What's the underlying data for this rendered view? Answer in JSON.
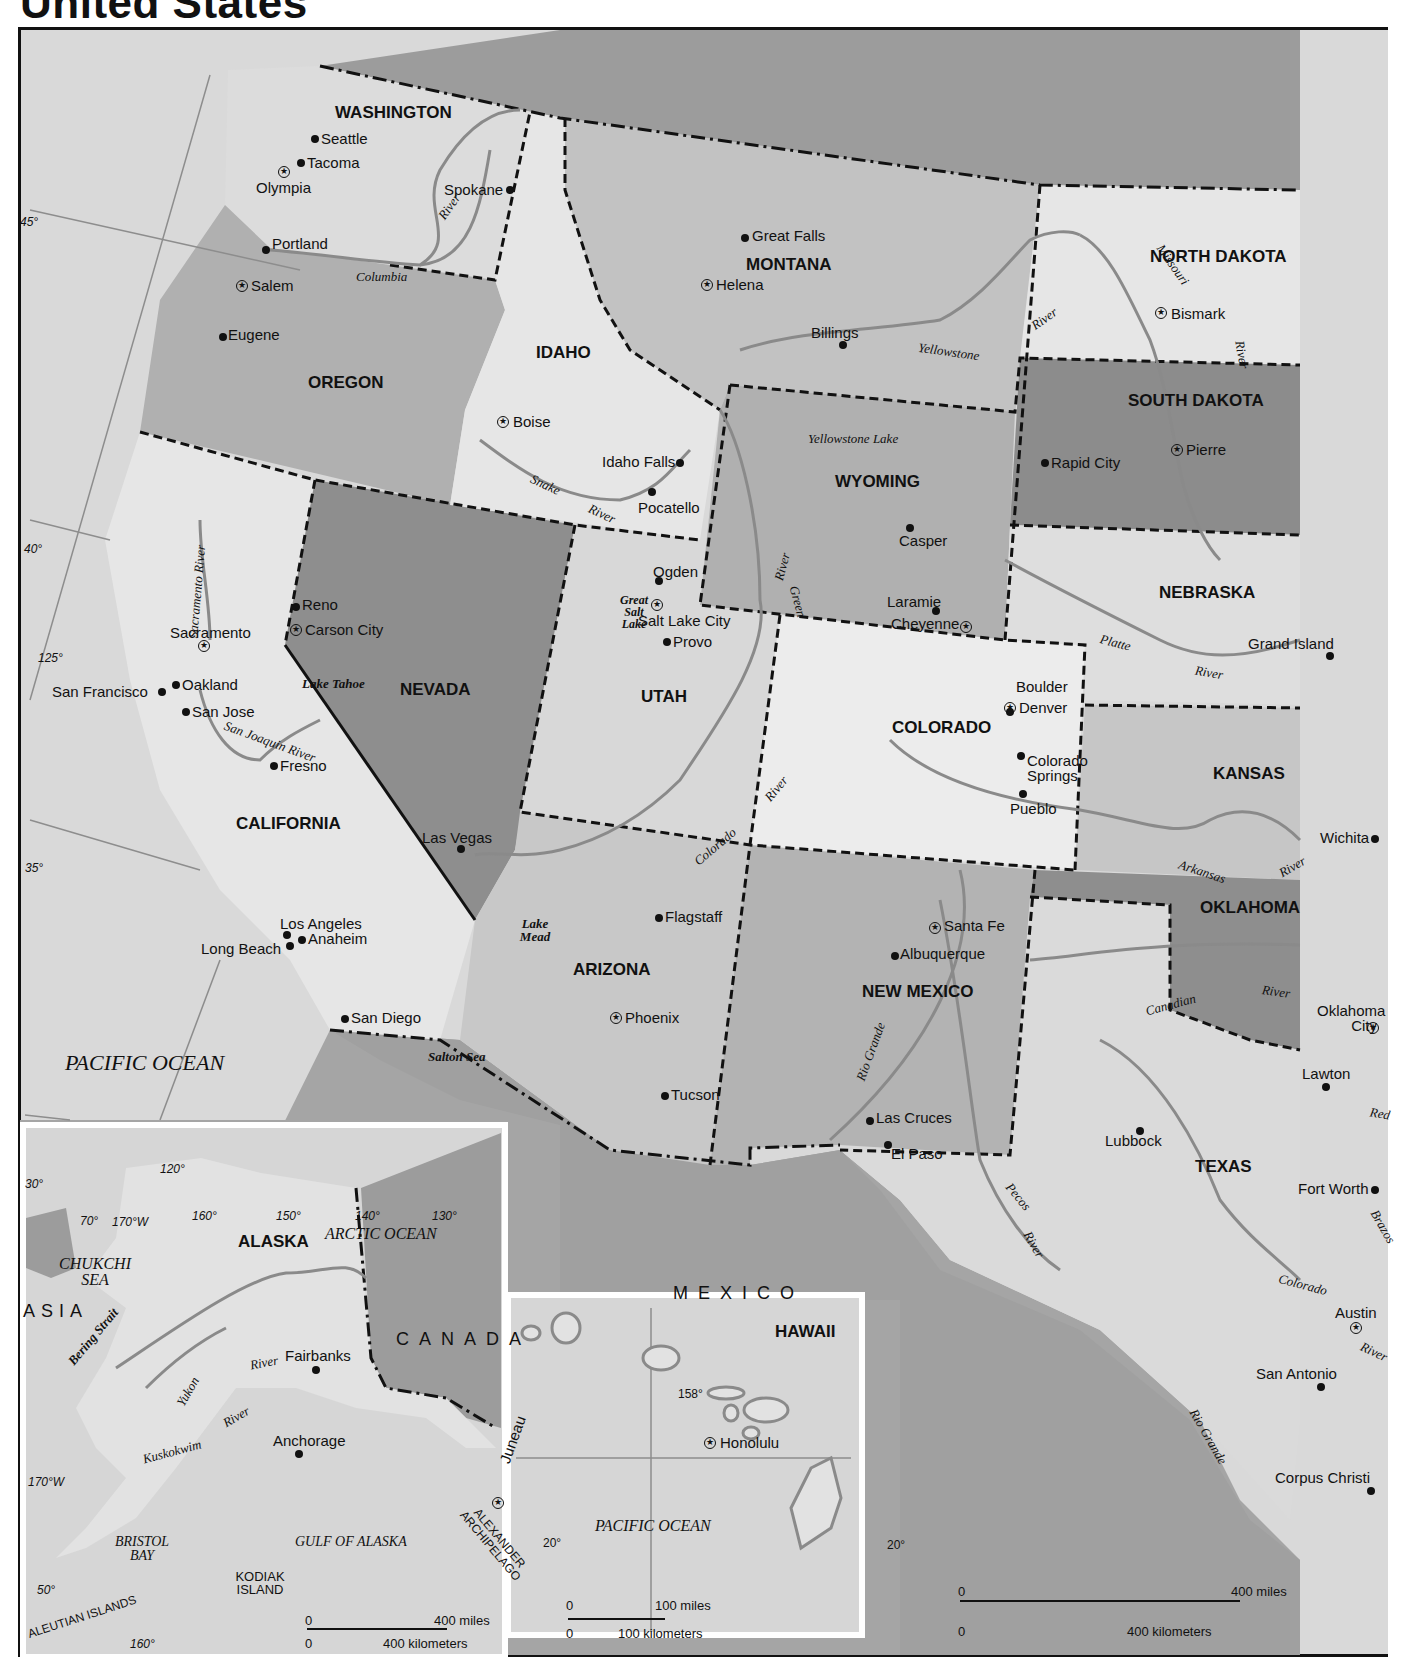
{
  "title": "United States",
  "colors": {
    "ocean": "#d9d9d9",
    "light_state": "#e8e8e8",
    "mid_state": "#b5b5b5",
    "dark_state": "#8e8e8e",
    "foreign": "#9c9c9c",
    "river": "#8a8a8a",
    "border": "#111111"
  },
  "states": [
    {
      "name": "WASHINGTON"
    },
    {
      "name": "OREGON"
    },
    {
      "name": "CALIFORNIA"
    },
    {
      "name": "IDAHO"
    },
    {
      "name": "NEVADA"
    },
    {
      "name": "MONTANA"
    },
    {
      "name": "WYOMING"
    },
    {
      "name": "UTAH"
    },
    {
      "name": "ARIZONA"
    },
    {
      "name": "COLORADO"
    },
    {
      "name": "NEW MEXICO"
    },
    {
      "name": "NORTH DAKOTA"
    },
    {
      "name": "SOUTH DAKOTA"
    },
    {
      "name": "NEBRASKA"
    },
    {
      "name": "KANSAS"
    },
    {
      "name": "OKLAHOMA"
    },
    {
      "name": "TEXAS"
    },
    {
      "name": "ALASKA"
    },
    {
      "name": "HAWAII"
    }
  ],
  "cities": [
    {
      "name": "Seattle"
    },
    {
      "name": "Tacoma"
    },
    {
      "name": "Olympia",
      "capital": true
    },
    {
      "name": "Spokane"
    },
    {
      "name": "Portland"
    },
    {
      "name": "Salem",
      "capital": true
    },
    {
      "name": "Eugene"
    },
    {
      "name": "Boise",
      "capital": true
    },
    {
      "name": "Idaho Falls"
    },
    {
      "name": "Pocatello"
    },
    {
      "name": "Great Falls"
    },
    {
      "name": "Helena",
      "capital": true
    },
    {
      "name": "Billings"
    },
    {
      "name": "Bismark",
      "capital": true
    },
    {
      "name": "Pierre",
      "capital": true
    },
    {
      "name": "Rapid City"
    },
    {
      "name": "Casper"
    },
    {
      "name": "Laramie"
    },
    {
      "name": "Cheyenne",
      "capital": true
    },
    {
      "name": "Ogden"
    },
    {
      "name": "Salt Lake City",
      "capital": true
    },
    {
      "name": "Provo"
    },
    {
      "name": "Reno"
    },
    {
      "name": "Carson City",
      "capital": true
    },
    {
      "name": "Las Vegas"
    },
    {
      "name": "Sacramento",
      "capital": true
    },
    {
      "name": "San Francisco"
    },
    {
      "name": "Oakland"
    },
    {
      "name": "San Jose"
    },
    {
      "name": "Fresno"
    },
    {
      "name": "Los Angeles"
    },
    {
      "name": "Long Beach"
    },
    {
      "name": "Anaheim"
    },
    {
      "name": "San Diego"
    },
    {
      "name": "Boulder"
    },
    {
      "name": "Denver",
      "capital": true
    },
    {
      "name": "Colorado Springs"
    },
    {
      "name": "Pueblo"
    },
    {
      "name": "Grand Island"
    },
    {
      "name": "Wichita"
    },
    {
      "name": "Flagstaff"
    },
    {
      "name": "Phoenix",
      "capital": true
    },
    {
      "name": "Tucson"
    },
    {
      "name": "Santa Fe",
      "capital": true
    },
    {
      "name": "Albuquerque"
    },
    {
      "name": "Las Cruces"
    },
    {
      "name": "El Paso"
    },
    {
      "name": "Oklahoma City",
      "capital": true
    },
    {
      "name": "Lawton"
    },
    {
      "name": "Lubbock"
    },
    {
      "name": "Fort Worth"
    },
    {
      "name": "Austin",
      "capital": true
    },
    {
      "name": "San Antonio"
    },
    {
      "name": "Corpus Christi"
    },
    {
      "name": "Fairbanks"
    },
    {
      "name": "Anchorage"
    },
    {
      "name": "Juneau",
      "capital": true
    },
    {
      "name": "Honolulu",
      "capital": true
    }
  ],
  "water_labels": {
    "columbia": "Columbia",
    "river": "River",
    "snake": "Snake",
    "missouri": "Missouri",
    "yellowstone": "Yellowstone",
    "yellowstone_lake": "Yellowstone Lake",
    "green": "Green",
    "great_salt_lake": "Great Salt Lake",
    "sacramento_river": "Sacramento River",
    "san_joaquin_river": "San Joaquin River",
    "lake_tahoe": "Lake Tahoe",
    "colorado": "Colorado",
    "lake_mead": "Lake Mead",
    "salton_sea": "Salton Sea",
    "platte": "Platte",
    "arkansas": "Arkansas",
    "canadian": "Canadian",
    "red": "Red",
    "rio_grande": "Rio Grande",
    "pecos": "Pecos",
    "brazos": "Brazos",
    "yukon": "Yukon",
    "kuskokwim": "Kuskokwim",
    "bering_strait": "Bering Strait"
  },
  "regions": {
    "pacific_ocean": "PACIFIC OCEAN",
    "mexico": "MEXICO",
    "canada": "CANADA",
    "asia": "ASIA",
    "arctic_ocean": "ARCTIC OCEAN",
    "chukchi_sea": "CHUKCHI SEA",
    "gulf_of_alaska": "GULF OF ALASKA",
    "bristol_bay": "BRISTOL BAY",
    "kodiak_island": "KODIAK ISLAND",
    "alexander_archipelago": "ALEXANDER ARCHIPELAGO",
    "aleutian_islands": "ALEUTIAN ISLANDS"
  },
  "graticule": {
    "main": [
      "45°",
      "40°",
      "125°",
      "35°",
      "120°",
      "30°"
    ],
    "alaska": [
      "70°",
      "170°W",
      "160°",
      "150°",
      "140°",
      "130°",
      "170°W",
      "50°",
      "160°"
    ],
    "hawaii": [
      "158°",
      "20°",
      "20°"
    ]
  },
  "scales": {
    "main": {
      "zero": "0",
      "miles": "400 miles",
      "km": "400 kilometers"
    },
    "alaska": {
      "zero": "0",
      "miles": "400 miles",
      "km": "400 kilometers"
    },
    "hawaii": {
      "zero": "0",
      "miles": "100 miles",
      "km": "100 kilometers"
    }
  }
}
